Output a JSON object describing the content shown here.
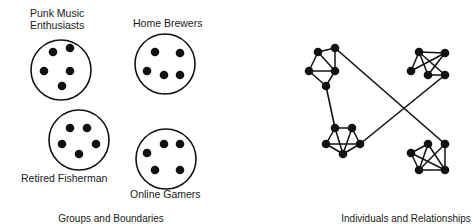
{
  "panels": [
    {
      "caption": "Groups and Boundaries",
      "groups": [
        {
          "label_lines": [
            "Punk Music",
            "Enthusiasts"
          ],
          "circle": {
            "cx": 61,
            "cy": 70,
            "r": 30
          },
          "members": [
            [
              53,
              52
            ],
            [
              70,
              48
            ],
            [
              44,
              71
            ],
            [
              70,
              71
            ],
            [
              62,
              86
            ]
          ]
        },
        {
          "label_lines": [
            "Home Brewers"
          ],
          "circle": {
            "cx": 165,
            "cy": 64,
            "r": 30
          },
          "members": [
            [
              155,
              52
            ],
            [
              180,
              53
            ],
            [
              147,
              71
            ],
            [
              164,
              75
            ],
            [
              180,
              75
            ]
          ]
        },
        {
          "label_lines": [
            "Retired Fisherman"
          ],
          "circle": {
            "cx": 79,
            "cy": 140,
            "r": 30
          },
          "members": [
            [
              70,
              128
            ],
            [
              87,
              128
            ],
            [
              62,
              144
            ],
            [
              96,
              144
            ],
            [
              79,
              154
            ]
          ]
        },
        {
          "label_lines": [
            "Online Gamers"
          ],
          "circle": {
            "cx": 166,
            "cy": 159,
            "r": 30
          },
          "members": [
            [
              164,
              144
            ],
            [
              180,
              144
            ],
            [
              147,
              153
            ],
            [
              155,
              170
            ],
            [
              180,
              170
            ]
          ]
        }
      ]
    },
    {
      "caption": "Individuals and Relationships",
      "clusters": [
        {
          "name": "cluster-top-left",
          "nodes": [
            [
              318,
              52
            ],
            [
              335,
              48
            ],
            [
              309,
              71
            ],
            [
              335,
              71
            ],
            [
              326,
              86
            ]
          ],
          "edges": [
            [
              0,
              1
            ],
            [
              0,
              2
            ],
            [
              0,
              3
            ],
            [
              1,
              3
            ],
            [
              2,
              3
            ],
            [
              2,
              4
            ],
            [
              3,
              4
            ]
          ]
        },
        {
          "name": "cluster-top-right",
          "nodes": [
            [
              419,
              52
            ],
            [
              445,
              53
            ],
            [
              411,
              71
            ],
            [
              428,
              75
            ],
            [
              445,
              75
            ]
          ],
          "edges": [
            [
              0,
              1
            ],
            [
              0,
              2
            ],
            [
              0,
              3
            ],
            [
              0,
              4
            ],
            [
              1,
              2
            ],
            [
              1,
              3
            ],
            [
              3,
              4
            ]
          ]
        },
        {
          "name": "cluster-bottom-left",
          "nodes": [
            [
              335,
              128
            ],
            [
              352,
              128
            ],
            [
              326,
              144
            ],
            [
              360,
              144
            ],
            [
              343,
              154
            ]
          ],
          "edges": [
            [
              0,
              1
            ],
            [
              0,
              2
            ],
            [
              0,
              4
            ],
            [
              1,
              3
            ],
            [
              1,
              4
            ],
            [
              2,
              3
            ],
            [
              2,
              4
            ],
            [
              3,
              4
            ]
          ]
        },
        {
          "name": "cluster-bottom-right",
          "nodes": [
            [
              428,
              144
            ],
            [
              445,
              144
            ],
            [
              411,
              153
            ],
            [
              419,
              170
            ],
            [
              445,
              170
            ]
          ],
          "edges": [
            [
              0,
              2
            ],
            [
              0,
              4
            ],
            [
              1,
              3
            ],
            [
              1,
              4
            ],
            [
              2,
              3
            ],
            [
              2,
              4
            ],
            [
              3,
              4
            ],
            [
              0,
              3
            ]
          ]
        }
      ],
      "bridges": [
        {
          "from": [
            335,
            48
          ],
          "to": [
            445,
            144
          ]
        },
        {
          "from": [
            360,
            144
          ],
          "to": [
            445,
            75
          ]
        },
        {
          "from": [
            326,
            86
          ],
          "to": [
            335,
            128
          ]
        }
      ]
    }
  ],
  "style": {
    "ink": "#111111",
    "background": "#ffffff",
    "node_radius": 4.3
  }
}
